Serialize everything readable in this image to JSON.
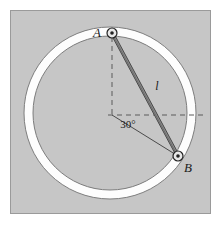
{
  "figure": {
    "type": "mechanics-diagram",
    "canvas": {
      "width": 224,
      "height": 231
    },
    "panel": {
      "name": "gray-background-panel",
      "x": 10,
      "y": 10,
      "width": 201,
      "height": 204,
      "fill_color": "#c6c6c6",
      "border_color": "#9a9a9a"
    },
    "ring": {
      "name": "circular-ring",
      "center_x": 110,
      "center_y": 113,
      "outer_radius": 86,
      "inner_radius": 77,
      "fill_color": "#fdfdfd",
      "stroke_color": "#7d7d7d"
    },
    "rod": {
      "name": "rod-AB",
      "label": "l",
      "label_x": 157,
      "label_y": 90,
      "fill_color": "#8c8c8c",
      "stroke_color": "#4a4a4a",
      "half_width": 4
    },
    "points": [
      {
        "id": "A",
        "label": "A",
        "x": 112,
        "y": 33,
        "label_x": 97,
        "label_y": 37,
        "pin_outer_radius": 5,
        "pin_inner_radius": 1.8
      },
      {
        "id": "B",
        "label": "B",
        "x": 178,
        "y": 156,
        "label_x": 188,
        "label_y": 172,
        "pin_outer_radius": 5,
        "pin_inner_radius": 1.8
      }
    ],
    "center_point": {
      "name": "ring-center",
      "x": 112,
      "y": 115
    },
    "angle": {
      "name": "angle-30",
      "label": "30°",
      "value": 30,
      "unit": "degrees",
      "label_x": 128,
      "label_y": 128,
      "from_ray": "horizontal-dashed-right",
      "to_ray": "center-to-B"
    },
    "dashed_lines": [
      {
        "name": "vertical-dashed-line",
        "x1": 112,
        "y1": 28,
        "x2": 112,
        "y2": 118,
        "color": "#5a5a5a"
      },
      {
        "name": "horizontal-dashed-line",
        "x1": 108,
        "y1": 115,
        "x2": 207,
        "y2": 115,
        "color": "#5a5a5a"
      }
    ],
    "solid_lines": [
      {
        "name": "center-to-B-ray",
        "x1": 112,
        "y1": 115,
        "x2": 178,
        "y2": 156,
        "color": "#4a4a4a"
      }
    ]
  }
}
